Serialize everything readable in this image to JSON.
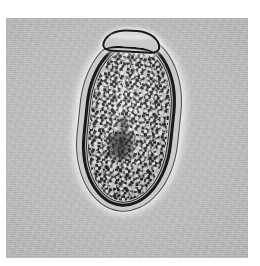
{
  "figure": {
    "kind": "photomicrograph",
    "modality": "brightfield light microscopy",
    "color_mode": "grayscale",
    "caption": "",
    "background_color": "#b5b5b5",
    "plate": {
      "x": 6,
      "y": 18,
      "width": 242,
      "height": 240
    },
    "page_margin_color": "#ffffff"
  },
  "specimen": {
    "name": "operculated helminth egg",
    "common_label": "trematode ovum",
    "shape": "ellipsoidal / ovoid",
    "orientation_degrees": 6,
    "bounding_box": {
      "x": 76,
      "y": 32,
      "width": 106,
      "height": 182
    }
  },
  "structures": [
    {
      "name": "operculum",
      "description": "flattened hinged lid at the anterior pole",
      "position": "top",
      "outline_color": "#181818"
    },
    {
      "name": "eggshell wall",
      "description": "thick smooth refractile shell, double-contoured",
      "outline_color": "#1a1a1a",
      "halo_color": "#ffffff"
    },
    {
      "name": "inner membrane",
      "description": "thin inner vitelline line",
      "outline_color": "#2d2d2d"
    },
    {
      "name": "yolk granules",
      "description": "dense coarse stippled vitelline cells filling the shell",
      "fill_color": "#cfcfcf",
      "granule_color": "#141414"
    },
    {
      "name": "germinal mass",
      "description": "darker aggregated cell cluster below centre",
      "position": "centre-lower",
      "fill_color": "#000000"
    }
  ],
  "colors": {
    "field": "#b5b5b5",
    "shell_dark": "#1a1a1a",
    "contents_light": "#cfcfcf",
    "halo": "#ffffff",
    "page": "#ffffff"
  }
}
